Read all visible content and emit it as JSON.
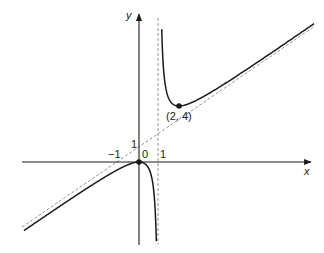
{
  "diagram": {
    "type": "function-graph",
    "function": "y = x^2/(x-1)",
    "axes": {
      "x_label": "x",
      "y_label": "y"
    },
    "tick_labels": {
      "x_neg_one": "−1",
      "origin": "0",
      "x_one": "1",
      "y_one": "1"
    },
    "points": [
      {
        "label": "(2, 4)",
        "x": 2,
        "y": 4
      },
      {
        "label": "",
        "x": 0,
        "y": 0
      }
    ],
    "asymptotes": [
      {
        "type": "vertical",
        "equation": "x = 1"
      },
      {
        "type": "oblique",
        "equation": "y = x + 1"
      }
    ],
    "colors": {
      "curve": "#1a1a1a",
      "asymptote": "#888888",
      "axis": "#1a1a1a"
    }
  }
}
